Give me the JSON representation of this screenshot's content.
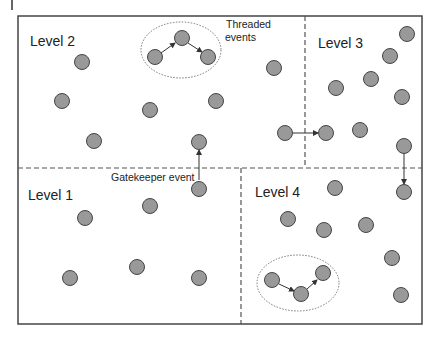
{
  "diagram": {
    "regions": [
      {
        "id": "level2",
        "label": "Level 2",
        "label_pos": [
          30,
          46
        ]
      },
      {
        "id": "level3",
        "label": "Level 3",
        "label_pos": [
          318,
          48
        ]
      },
      {
        "id": "level1",
        "label": "Level 1",
        "label_pos": [
          28,
          200
        ]
      },
      {
        "id": "level4",
        "label": "Level 4",
        "label_pos": [
          255,
          197
        ]
      }
    ],
    "annotations": {
      "threaded": [
        "Threaded",
        "events"
      ],
      "gatekeeper": "Gatekeeper event"
    },
    "colors": {
      "node_fill": "#999999",
      "node_stroke": "#444444",
      "line": "#333333"
    },
    "nodes": [
      [
        82,
        62
      ],
      [
        62,
        101
      ],
      [
        150,
        110
      ],
      [
        216,
        101
      ],
      [
        94,
        141
      ],
      [
        199,
        142
      ],
      [
        274,
        68
      ],
      [
        155,
        57
      ],
      [
        182,
        38
      ],
      [
        208,
        57
      ],
      [
        407,
        34
      ],
      [
        390,
        56
      ],
      [
        371,
        79
      ],
      [
        336,
        88
      ],
      [
        402,
        97
      ],
      [
        285,
        133
      ],
      [
        326,
        133
      ],
      [
        360,
        130
      ],
      [
        404,
        146
      ],
      [
        85,
        218
      ],
      [
        150,
        206
      ],
      [
        199,
        189
      ],
      [
        70,
        278
      ],
      [
        137,
        267
      ],
      [
        199,
        278
      ],
      [
        335,
        188
      ],
      [
        404,
        192
      ],
      [
        288,
        219
      ],
      [
        324,
        230
      ],
      [
        366,
        225
      ],
      [
        392,
        258
      ],
      [
        401,
        295
      ],
      [
        272,
        280
      ],
      [
        301,
        294
      ],
      [
        323,
        273
      ]
    ]
  }
}
